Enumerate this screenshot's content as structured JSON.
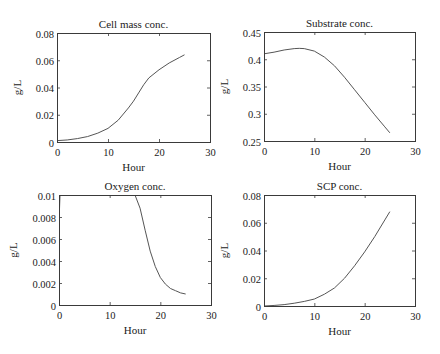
{
  "chart_data": [
    {
      "type": "line",
      "title": "Cell mass conc.",
      "xlabel": "Hour",
      "ylabel": "g/L",
      "xlim": [
        0,
        30
      ],
      "ylim": [
        0,
        0.08
      ],
      "xticks": [
        0,
        10,
        20,
        30
      ],
      "xtick_labels": [
        "0",
        "10",
        "20",
        "30"
      ],
      "yticks": [
        0,
        0.02,
        0.04,
        0.06,
        0.08
      ],
      "ytick_labels": [
        "0",
        "0.02",
        "0.04",
        "0.06",
        "0.08"
      ],
      "grid": false,
      "box": {
        "left": 57,
        "top": 33,
        "right": 210,
        "bottom": 142
      },
      "series": [
        {
          "name": "Cell mass",
          "x": [
            0,
            2,
            4,
            6,
            8,
            10,
            12,
            14,
            15,
            16,
            17,
            18,
            20,
            22,
            24,
            25
          ],
          "y": [
            0.001,
            0.0015,
            0.0025,
            0.004,
            0.0065,
            0.01,
            0.016,
            0.025,
            0.03,
            0.036,
            0.042,
            0.047,
            0.053,
            0.058,
            0.062,
            0.064
          ]
        }
      ]
    },
    {
      "type": "line",
      "title": "Substrate conc.",
      "xlabel": "Hour",
      "ylabel": "g/L",
      "xlim": [
        0,
        30
      ],
      "ylim": [
        0.25,
        0.45
      ],
      "xticks": [
        0,
        10,
        20,
        30
      ],
      "xtick_labels": [
        "0",
        "10",
        "20",
        "30"
      ],
      "yticks": [
        0.25,
        0.3,
        0.35,
        0.4,
        0.45
      ],
      "ytick_labels": [
        "0.25",
        "0.3",
        "0.35",
        "0.4",
        "0.45"
      ],
      "grid": false,
      "box": {
        "left": 264,
        "top": 32,
        "right": 415,
        "bottom": 141
      },
      "series": [
        {
          "name": "Substrate",
          "x": [
            0,
            2,
            4,
            6,
            7,
            8,
            10,
            12,
            14,
            16,
            18,
            20,
            22,
            24,
            25
          ],
          "y": [
            0.41,
            0.413,
            0.417,
            0.4195,
            0.42,
            0.4195,
            0.415,
            0.404,
            0.388,
            0.367,
            0.344,
            0.321,
            0.298,
            0.276,
            0.265
          ]
        }
      ]
    },
    {
      "type": "line",
      "title": "Oxygen conc.",
      "xlabel": "Hour",
      "ylabel": "g/L",
      "xlim": [
        0,
        30
      ],
      "ylim": [
        0,
        0.01
      ],
      "xticks": [
        0,
        10,
        20,
        30
      ],
      "xtick_labels": [
        "0",
        "10",
        "20",
        "30"
      ],
      "yticks": [
        0,
        0.002,
        0.004,
        0.006,
        0.008,
        0.01
      ],
      "ytick_labels": [
        "0",
        "0.002",
        "0.004",
        "0.006",
        "0.008",
        "0.01"
      ],
      "grid": false,
      "box": {
        "left": 59,
        "top": 195,
        "right": 211,
        "bottom": 305
      },
      "series": [
        {
          "name": "Oxygen",
          "x": [
            0,
            0.2,
            0.4,
            14.8,
            15,
            16,
            17,
            18,
            19,
            20,
            21,
            22,
            23,
            24,
            25
          ],
          "y": [
            0.0075,
            0.01,
            0.01,
            0.01,
            0.01,
            0.0088,
            0.0068,
            0.0049,
            0.0035,
            0.0025,
            0.0019,
            0.0015,
            0.0013,
            0.0011,
            0.001
          ]
        }
      ]
    },
    {
      "type": "line",
      "title": "SCP conc.",
      "xlabel": "Hour",
      "ylabel": "g/L",
      "xlim": [
        0,
        30
      ],
      "ylim": [
        0,
        0.08
      ],
      "xticks": [
        0,
        10,
        20,
        30
      ],
      "xtick_labels": [
        "0",
        "10",
        "20",
        "30"
      ],
      "yticks": [
        0,
        0.02,
        0.04,
        0.06,
        0.08
      ],
      "ytick_labels": [
        "0",
        "0.02",
        "0.04",
        "0.06",
        "0.08"
      ],
      "grid": false,
      "box": {
        "left": 264,
        "top": 195,
        "right": 415,
        "bottom": 306
      },
      "series": [
        {
          "name": "SCP",
          "x": [
            0,
            2,
            4,
            6,
            8,
            10,
            12,
            14,
            16,
            18,
            20,
            22,
            24,
            25
          ],
          "y": [
            0,
            0.0004,
            0.001,
            0.002,
            0.0033,
            0.005,
            0.0085,
            0.013,
            0.02,
            0.029,
            0.039,
            0.05,
            0.062,
            0.068
          ]
        }
      ]
    }
  ]
}
